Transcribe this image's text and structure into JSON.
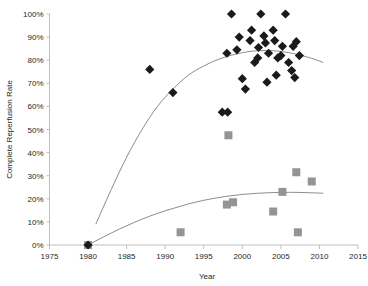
{
  "chart_data": {
    "type": "scatter",
    "title": "",
    "xlabel": "Year",
    "ylabel": "Complete Reperfusion Rate",
    "xlim": [
      1975,
      2015
    ],
    "ylim": [
      0,
      1.0
    ],
    "grid": false,
    "legend_position": "none",
    "x_ticks": [
      1975,
      1980,
      1985,
      1990,
      1995,
      2000,
      2005,
      2010,
      2015
    ],
    "x_tick_labels": [
      "1975",
      "1980",
      "1985",
      "1990",
      "1995",
      "2000",
      "2005",
      "2010",
      "2015"
    ],
    "y_ticks": [
      0,
      0.1,
      0.2,
      0.3,
      0.4,
      0.5,
      0.6,
      0.7,
      0.8,
      0.9,
      1.0
    ],
    "y_tick_labels": [
      "0%",
      "10%",
      "20%",
      "30%",
      "40%",
      "50%",
      "60%",
      "70%",
      "80%",
      "90%",
      "100%"
    ],
    "series": [
      {
        "name": "Complete reperfusion (diamond)",
        "marker": "diamond",
        "color": "#1a1a1a",
        "points": [
          [
            1980,
            0.0
          ],
          [
            1988,
            0.76
          ],
          [
            1991,
            0.66
          ],
          [
            1997.4,
            0.575
          ],
          [
            1998.1,
            0.575
          ],
          [
            1998.0,
            0.83
          ],
          [
            1998.6,
            1.0
          ],
          [
            1999.6,
            0.9
          ],
          [
            1999.3,
            0.845
          ],
          [
            2000.0,
            0.72
          ],
          [
            2000.4,
            0.675
          ],
          [
            2001.2,
            0.93
          ],
          [
            2001.0,
            0.885
          ],
          [
            2001.6,
            0.79
          ],
          [
            2002.1,
            0.855
          ],
          [
            2002.0,
            0.81
          ],
          [
            2002.4,
            1.0
          ],
          [
            2002.8,
            0.905
          ],
          [
            2003.0,
            0.875
          ],
          [
            2003.4,
            0.83
          ],
          [
            2003.2,
            0.705
          ],
          [
            2004.0,
            0.93
          ],
          [
            2004.2,
            0.885
          ],
          [
            2004.6,
            0.81
          ],
          [
            2004.4,
            0.735
          ],
          [
            2005.2,
            0.86
          ],
          [
            2005.0,
            0.82
          ],
          [
            2005.6,
            1.0
          ],
          [
            2006.0,
            0.79
          ],
          [
            2006.6,
            0.86
          ],
          [
            2006.4,
            0.755
          ],
          [
            2006.8,
            0.725
          ],
          [
            2007.4,
            0.82
          ],
          [
            2007.0,
            0.88
          ]
        ]
      },
      {
        "name": "TIMI 3 flow subset (square)",
        "marker": "square",
        "color": "#949494",
        "points": [
          [
            1980,
            0.0
          ],
          [
            1992,
            0.055
          ],
          [
            1998.0,
            0.175
          ],
          [
            1998.8,
            0.185
          ],
          [
            1998.2,
            0.475
          ],
          [
            2004.0,
            0.145
          ],
          [
            2005.2,
            0.23
          ],
          [
            2007.0,
            0.315
          ],
          [
            2007.2,
            0.055
          ],
          [
            2009.0,
            0.275
          ]
        ]
      }
    ],
    "trendlines": [
      {
        "name": "upper-trend-curve",
        "for_series": "Complete reperfusion (diamond)",
        "x_start": 1981.0,
        "x_end": 2010.5,
        "points": [
          [
            1981.0,
            0.09
          ],
          [
            1983.0,
            0.24
          ],
          [
            1985.0,
            0.38
          ],
          [
            1987.0,
            0.5
          ],
          [
            1989.0,
            0.6
          ],
          [
            1991.0,
            0.675
          ],
          [
            1993.0,
            0.735
          ],
          [
            1995.0,
            0.775
          ],
          [
            1997.0,
            0.805
          ],
          [
            1999.0,
            0.825
          ],
          [
            2001.0,
            0.838
          ],
          [
            2003.0,
            0.842
          ],
          [
            2005.0,
            0.838
          ],
          [
            2007.0,
            0.826
          ],
          [
            2009.0,
            0.808
          ],
          [
            2010.5,
            0.79
          ]
        ]
      },
      {
        "name": "lower-trend-curve",
        "for_series": "TIMI 3 flow subset (square)",
        "x_start": 1980.0,
        "x_end": 2010.5,
        "points": [
          [
            1980.0,
            0.0
          ],
          [
            1982.0,
            0.035
          ],
          [
            1984.0,
            0.068
          ],
          [
            1986.0,
            0.098
          ],
          [
            1988.0,
            0.125
          ],
          [
            1990.0,
            0.148
          ],
          [
            1992.0,
            0.168
          ],
          [
            1994.0,
            0.186
          ],
          [
            1996.0,
            0.2
          ],
          [
            1998.0,
            0.211
          ],
          [
            2000.0,
            0.219
          ],
          [
            2002.0,
            0.224
          ],
          [
            2004.0,
            0.227
          ],
          [
            2006.0,
            0.228
          ],
          [
            2008.0,
            0.227
          ],
          [
            2010.5,
            0.224
          ]
        ]
      }
    ]
  }
}
